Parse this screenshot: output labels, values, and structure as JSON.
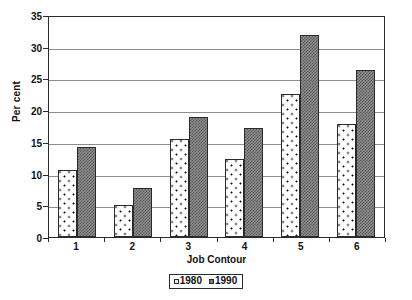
{
  "chart_data": {
    "type": "bar",
    "title": "",
    "xlabel": "Job Contour",
    "ylabel": "Per cent",
    "categories": [
      "1",
      "2",
      "3",
      "4",
      "5",
      "6"
    ],
    "ylim": [
      0,
      35
    ],
    "yticks": [
      "0",
      "5",
      "10",
      "15",
      "20",
      "25",
      "30",
      "35"
    ],
    "grid": true,
    "legend_position": "bottom",
    "series": [
      {
        "name": "1980",
        "values": [
          10.5,
          5.0,
          15.4,
          12.3,
          22.5,
          17.8
        ]
      },
      {
        "name": "1990",
        "values": [
          14.2,
          7.8,
          19.0,
          17.2,
          31.9,
          26.3
        ]
      }
    ]
  },
  "colors": {
    "series_1980": "#ffffff",
    "series_1990": "#8d8d8d",
    "axis": "#2b2b2b",
    "grid": "#8e8e8e"
  }
}
